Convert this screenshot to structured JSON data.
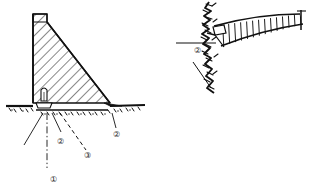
{
  "figure": {
    "title": "",
    "background_color": "#ffffff",
    "ink_color": "#111111",
    "type": "engineering-line-drawing",
    "panels": [
      {
        "id": "left",
        "name": "gravity-dam-cross-section",
        "view": "cross-section",
        "description": "Hatched triangular gravity dam body on ground line with foundation stipple"
      },
      {
        "id": "right",
        "name": "arch-dam-plan-view",
        "view": "plan",
        "description": "Curved dam band with vertical contraction-joint ribs abutting jagged rock face"
      }
    ]
  },
  "callouts": {
    "left_panel": [
      {
        "key": "c1",
        "label": "①",
        "number": "1",
        "leader": "dash-dot-vertical"
      },
      {
        "key": "c2a",
        "label": "②",
        "number": "2",
        "leader": "solid-diagonal"
      },
      {
        "key": "c3",
        "label": "③",
        "number": "3",
        "leader": "dashed-diagonal"
      },
      {
        "key": "c2b",
        "label": "②",
        "number": "2",
        "leader": "solid-diagonal"
      }
    ],
    "right_panel": [
      {
        "key": "r2",
        "label": "②",
        "number": "2",
        "leader": "horizontal"
      }
    ]
  },
  "geometry": {
    "left": {
      "crest_parapet": "small vertical block at dam crest",
      "upstream_face": "vertical",
      "downstream_face": "sloped",
      "gallery": "small rectangular opening at heel",
      "ground_line": "horizontal with stipple texture",
      "hatch_angle_deg": 45
    },
    "right": {
      "rib_count": 14,
      "curvature": "convex upstream arc",
      "abutment": "jagged rock face"
    }
  },
  "colors": {
    "ink": "#111111",
    "hatch": "#1a1a1a",
    "ground": "#000000",
    "paper": "#ffffff"
  }
}
